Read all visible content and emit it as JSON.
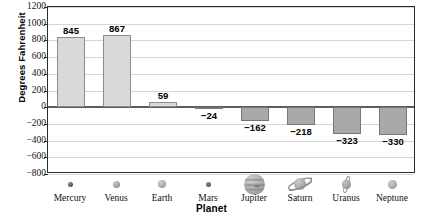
{
  "chart_data": {
    "type": "bar",
    "title": "",
    "xlabel": "Planet",
    "ylabel": "Degrees Fahrenheit",
    "categories": [
      "Mercury",
      "Venus",
      "Earth",
      "Mars",
      "Jupiter",
      "Saturn",
      "Uranus",
      "Neptune"
    ],
    "values": [
      845,
      867,
      59,
      -24,
      -162,
      -218,
      -323,
      -330
    ],
    "value_labels": [
      "845",
      "867",
      "59",
      "−24",
      "−162",
      "−218",
      "−323",
      "−330"
    ],
    "ylim": [
      -800,
      1200
    ],
    "ytick_values": [
      1200,
      1000,
      800,
      600,
      400,
      200,
      0,
      -200,
      -400,
      -600,
      -800
    ],
    "ytick_labels": [
      "1200",
      "1000",
      "800",
      "600",
      "400",
      "200",
      "0",
      "−200",
      "−400",
      "−600",
      "−800"
    ],
    "grid": true,
    "legend": "none",
    "positive_bar_color": "#d9d9d9",
    "negative_bar_color": "#a9a9a9",
    "bar_border_color": "#8d8d8d",
    "gridline_color": "#d6d6d6",
    "zeroline_color": "#5c5c5c",
    "axis_color": "#2b2b2b"
  },
  "planet_icons": [
    {
      "name": "mercury-icon",
      "size": 5,
      "type": "plain",
      "color": "#4a4a4a",
      "highlight": "#8a8a8a"
    },
    {
      "name": "venus-icon",
      "size": 7,
      "type": "plain",
      "color": "#8d8d8d",
      "highlight": "#c9c9c9"
    },
    {
      "name": "earth-icon",
      "size": 8,
      "type": "plain",
      "color": "#9a9a9a",
      "highlight": "#d2d2d2"
    },
    {
      "name": "mars-icon",
      "size": 5,
      "type": "plain",
      "color": "#4f4f4f",
      "highlight": "#8f8f8f"
    },
    {
      "name": "jupiter-icon",
      "size": 21,
      "type": "banded",
      "color": "#9c9c9c",
      "highlight": "#cfcfcf"
    },
    {
      "name": "saturn-icon",
      "size": 12,
      "type": "ringed",
      "color": "#9a9a9a",
      "highlight": "#cccccc"
    },
    {
      "name": "uranus-icon",
      "size": 9,
      "type": "vring",
      "color": "#8f8f8f",
      "highlight": "#c4c4c4"
    },
    {
      "name": "neptune-icon",
      "size": 9,
      "type": "plain",
      "color": "#9b9b9b",
      "highlight": "#cfcfcf"
    }
  ]
}
